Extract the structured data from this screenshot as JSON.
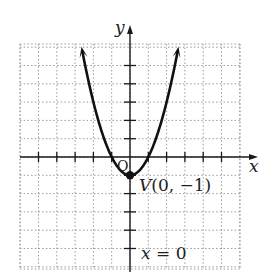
{
  "chart_data": {
    "type": "line",
    "title": "",
    "xlabel": "x",
    "ylabel": "y",
    "xlim": [
      -6,
      6
    ],
    "ylim": [
      -6,
      6
    ],
    "grid": true,
    "grid_style": "dotted",
    "tick_marks": "every 1 unit, unlabeled",
    "origin_label": "O",
    "series": [
      {
        "name": "parabola",
        "equation": "y = x^2 - 1",
        "x": [
          -2.6,
          -2,
          -1.5,
          -1,
          -0.5,
          0,
          0.5,
          1,
          1.5,
          2,
          2.6
        ],
        "y": [
          5.76,
          3,
          1.25,
          0,
          -0.75,
          -1,
          -0.75,
          0,
          1.25,
          3,
          5.76
        ],
        "arrows_at_ends": true
      }
    ],
    "annotations": [
      {
        "text": "V(0, −1)",
        "x": 0,
        "y": -1,
        "marker": "filled-dot"
      },
      {
        "text": "x = 0",
        "x": 0,
        "y": -5.6,
        "note": "axis of symmetry label"
      }
    ]
  },
  "labels": {
    "x_axis": "x",
    "y_axis": "y",
    "origin": "O",
    "vertex": "V(0, −1)",
    "axis_of_symmetry": "x = 0"
  },
  "colors": {
    "curve": "#111111",
    "axis": "#1a1a1a",
    "grid": "#9a9a9a",
    "background": "#ffffff"
  }
}
